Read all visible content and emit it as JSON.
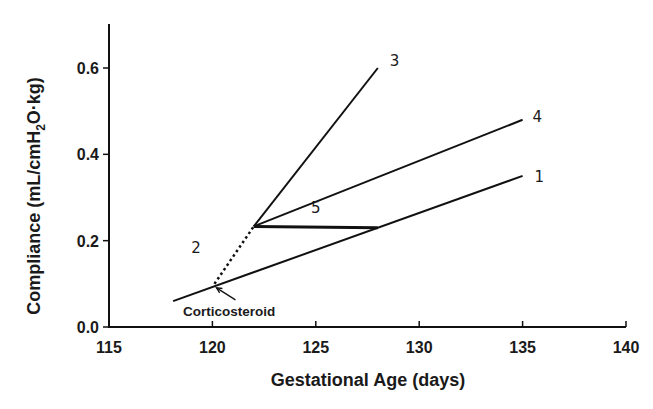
{
  "chart_data": {
    "type": "line",
    "title": "",
    "xlabel": "Gestational Age (days)",
    "ylabel_parts": {
      "pre": "Compliance (mL/cmH",
      "sub": "2",
      "post": "O·kg)"
    },
    "ylabel": "Compliance (mL/cmH2O·kg)",
    "xlim": [
      115,
      140
    ],
    "ylim": [
      0,
      0.7
    ],
    "xticks": [
      115,
      120,
      125,
      130,
      135,
      140
    ],
    "xtick_labels": [
      "115",
      "120",
      "125",
      "130",
      "135",
      "140"
    ],
    "yticks": [
      0.0,
      0.2,
      0.4,
      0.6
    ],
    "ytick_labels": [
      "0.0",
      "0.2",
      "0.4",
      "0.6"
    ],
    "grid": false,
    "legend": "none (lines labeled inline at ends)",
    "series": [
      {
        "name": "1",
        "style": "solid",
        "x": [
          118.1,
          135
        ],
        "y": [
          0.06,
          0.35
        ]
      },
      {
        "name": "2",
        "style": "dotted",
        "x": [
          120.1,
          122
        ],
        "y": [
          0.1,
          0.233
        ]
      },
      {
        "name": "3",
        "style": "solid",
        "x": [
          122,
          128
        ],
        "y": [
          0.233,
          0.6
        ]
      },
      {
        "name": "4",
        "style": "solid",
        "x": [
          122,
          135
        ],
        "y": [
          0.233,
          0.48
        ]
      },
      {
        "name": "5",
        "style": "solid-thick",
        "x": [
          122,
          128
        ],
        "y": [
          0.233,
          0.23
        ]
      }
    ],
    "annotations": [
      {
        "text": "Corticosteroid",
        "points_to": {
          "x": 120.1,
          "y": 0.1
        },
        "arrow": true
      }
    ],
    "color": "#111111"
  }
}
